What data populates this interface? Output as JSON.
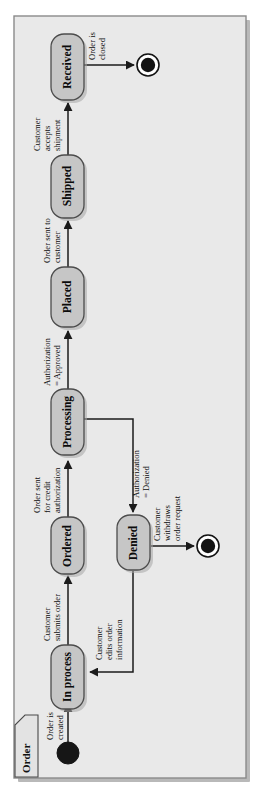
{
  "diagram": {
    "kind": "uml-state-machine",
    "frame_label": "Order",
    "orientation": "rotated-90-ccw",
    "colors": {
      "state_fill": "#c6c6c6",
      "state_stroke": "#4c4c4c",
      "frame_fill": "#e9e9e9",
      "frame_stroke": "#8a8a8a",
      "edge": "#1b1b1b",
      "node_fill": "#131313",
      "page_background": "#ffffff"
    },
    "states": [
      {
        "id": "in-process",
        "label": "In process"
      },
      {
        "id": "ordered",
        "label": "Ordered"
      },
      {
        "id": "processing",
        "label": "Processing"
      },
      {
        "id": "placed",
        "label": "Placed"
      },
      {
        "id": "shipped",
        "label": "Shipped"
      },
      {
        "id": "received",
        "label": "Received"
      },
      {
        "id": "denied",
        "label": "Denied"
      }
    ],
    "pseudostates": [
      {
        "id": "initial-state",
        "type": "initial"
      },
      {
        "id": "final-state-closed",
        "type": "final"
      },
      {
        "id": "final-state-withdrawn",
        "type": "final"
      }
    ],
    "transitions": [
      {
        "id": "t-start",
        "from": "initial-state",
        "to": "in-process",
        "label_lines": [
          "Order is",
          "created"
        ]
      },
      {
        "id": "t-submit",
        "from": "in-process",
        "to": "ordered",
        "label_lines": [
          "Customer",
          "submits order"
        ]
      },
      {
        "id": "t-credit",
        "from": "ordered",
        "to": "processing",
        "label_lines": [
          "Order sent",
          "for credit",
          "authorization"
        ]
      },
      {
        "id": "t-approved",
        "from": "processing",
        "to": "placed",
        "label_lines": [
          "Authorization",
          "= Approved"
        ]
      },
      {
        "id": "t-ship",
        "from": "placed",
        "to": "shipped",
        "label_lines": [
          "Order sent to",
          "customer"
        ]
      },
      {
        "id": "t-accept",
        "from": "shipped",
        "to": "received",
        "label_lines": [
          "Customer",
          "accepts",
          "shipment"
        ]
      },
      {
        "id": "t-closed",
        "from": "received",
        "to": "final-state-closed",
        "label_lines": [
          "Order is",
          "closed"
        ]
      },
      {
        "id": "t-denied",
        "from": "processing",
        "to": "denied",
        "label_lines": [
          "Authorization",
          "= Denied"
        ]
      },
      {
        "id": "t-withdraw",
        "from": "denied",
        "to": "final-state-withdrawn",
        "label_lines": [
          "Customer",
          "withdraws",
          "order request"
        ]
      },
      {
        "id": "t-edit",
        "from": "denied",
        "to": "in-process",
        "label_lines": [
          "Customer",
          "edits order",
          "information"
        ]
      }
    ]
  }
}
